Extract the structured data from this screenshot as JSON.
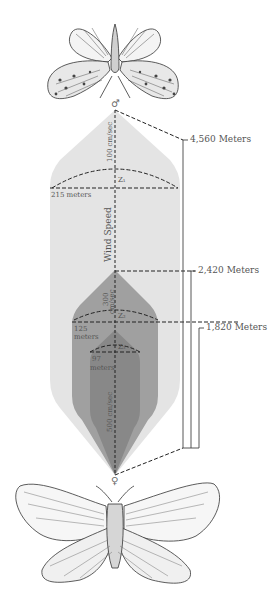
{
  "diagram": {
    "male_symbol": "♂",
    "female_symbol": "♀",
    "axis_label": "Wind Speed",
    "outer_plume": {
      "speed_label": "100 cm/sec",
      "width_label": "215 meters",
      "zone_label": "Z₁",
      "color": "#e4e4e4"
    },
    "middle_plume": {
      "speed_label_line1": "300",
      "speed_label_line2": "cm/sec",
      "width_label_line1": "125",
      "width_label_line2": "meters",
      "zone_label": "Z₂",
      "color": "#9c9c9c"
    },
    "inner_plume": {
      "speed_label": "500 cm/sec",
      "width_label_line1": "97",
      "width_label_line2": "meters",
      "zone_label": "Z₃",
      "color": "#868686"
    },
    "distances": [
      {
        "label": "4,560 Meters"
      },
      {
        "label": "2,420 Meters"
      },
      {
        "label": "1,820 Meters"
      }
    ],
    "illustrations": {
      "top": "male-moth",
      "bottom": "female-moth"
    }
  }
}
